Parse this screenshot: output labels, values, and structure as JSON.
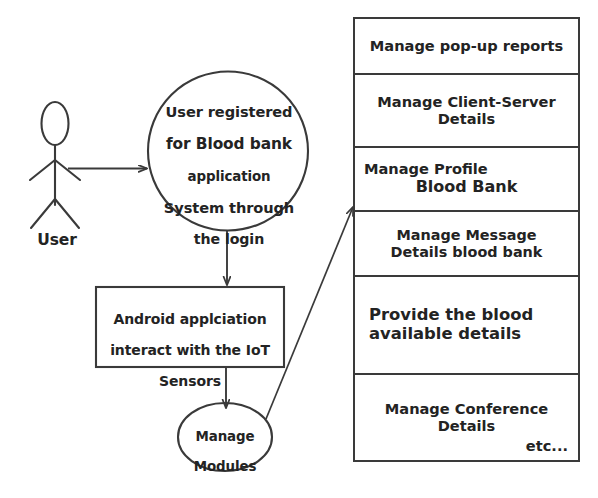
{
  "diagram": {
    "type": "use-case-diagram",
    "actor": {
      "name": "user-actor",
      "label": "User"
    },
    "main_usecase": {
      "name": "main-usecase-ellipse",
      "lines": [
        "User registered",
        "for Blood bank",
        "application",
        "System through",
        "the login"
      ],
      "text": "User registered for Blood bank application System through the login"
    },
    "process_box": {
      "name": "android-process-box",
      "lines": [
        "Android applciation",
        "interact with the IoT",
        "Sensors"
      ],
      "text": "Android applciation interact with the IoT Sensors"
    },
    "modules_usecase": {
      "name": "manage-modules-ellipse",
      "lines": [
        "Manage",
        "Modules"
      ],
      "text": "Manage Modules"
    },
    "feature_table": {
      "name": "feature-list-table",
      "rows": [
        {
          "text": "Manage pop-up reports"
        },
        {
          "text": "Manage Client-Server\nDetails"
        },
        {
          "text": "Manage Profile",
          "sub": "Blood Bank"
        },
        {
          "text": "Manage Message\nDetails blood bank"
        },
        {
          "text": "Provide the blood\navailable details"
        },
        {
          "text": "Manage Conference\nDetails",
          "note": "etc..."
        }
      ]
    },
    "connectors": [
      {
        "name": "actor-to-usecase-arrow",
        "from": "user-actor",
        "to": "main-usecase-ellipse"
      },
      {
        "name": "usecase-to-box-arrow",
        "from": "main-usecase-ellipse",
        "to": "android-process-box"
      },
      {
        "name": "box-to-modules-arrow",
        "from": "android-process-box",
        "to": "manage-modules-ellipse"
      },
      {
        "name": "modules-to-table-arrow",
        "from": "manage-modules-ellipse",
        "to": "feature-list-table"
      }
    ],
    "colors": {
      "stroke": "#3a3a3a",
      "text": "#232323",
      "background": "#ffffff"
    }
  }
}
